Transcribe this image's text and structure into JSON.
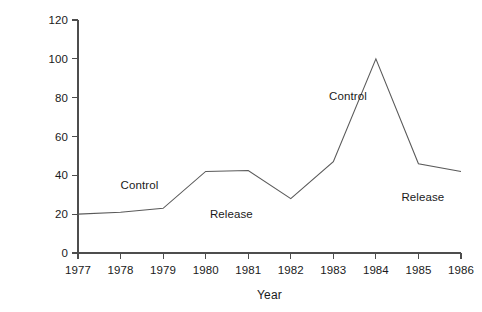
{
  "chart_data": {
    "type": "line",
    "title": "",
    "xlabel": "Year",
    "ylabel": "Index of rabbit survival",
    "x": [
      1977,
      1978,
      1979,
      1980,
      1981,
      1982,
      1983,
      1984,
      1985,
      1986
    ],
    "categories": [
      "1977",
      "1978",
      "1979",
      "1980",
      "1981",
      "1982",
      "1983",
      "1984",
      "1985",
      "1986"
    ],
    "values": [
      20,
      21,
      23,
      42,
      42.5,
      28,
      47,
      100,
      46,
      42
    ],
    "series": [
      {
        "name": "Index of rabbit survival",
        "values": [
          20,
          21,
          23,
          42,
          42.5,
          28,
          47,
          100,
          46,
          42
        ]
      }
    ],
    "xlim": [
      1977,
      1986
    ],
    "ylim": [
      0,
      120
    ],
    "yticks": [
      0,
      20,
      40,
      60,
      80,
      100,
      120
    ],
    "ytick_labels": [
      "0",
      "20",
      "40",
      "60",
      "80",
      "100",
      "120"
    ],
    "xticks": [
      1977,
      1978,
      1979,
      1980,
      1981,
      1982,
      1983,
      1984,
      1985,
      1986
    ],
    "xtick_labels": [
      "1977",
      "1978",
      "1979",
      "1980",
      "1981",
      "1982",
      "1983",
      "1984",
      "1985",
      "1986"
    ],
    "grid": false,
    "legend": "none",
    "line_color": "#5a5a5a",
    "axis_color": "#4d4d4d",
    "background": "#ffffff",
    "annotations": [
      {
        "text": "Control",
        "x": 1978.0,
        "y": 38
      },
      {
        "text": "Release",
        "x": 1980.1,
        "y": 23
      },
      {
        "text": "Control",
        "x": 1982.9,
        "y": 84
      },
      {
        "text": "Release",
        "x": 1984.6,
        "y": 32
      }
    ]
  }
}
